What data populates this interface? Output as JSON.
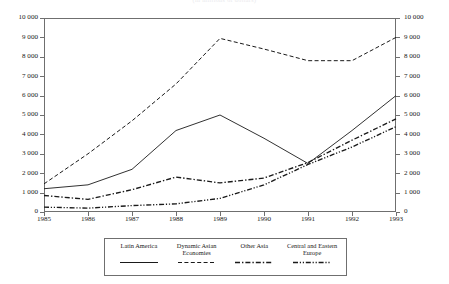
{
  "chart_title": "(in millions of dollars)",
  "axes": {
    "y_ticks": [
      "0",
      "1 000",
      "2 000",
      "3 000",
      "4 000",
      "5 000",
      "6 000",
      "7 000",
      "8 000",
      "9 000",
      "10 000"
    ],
    "x_ticks": [
      "1985",
      "1986",
      "1987",
      "1988",
      "1989",
      "1990",
      "1991",
      "1992",
      "1993"
    ],
    "ylabel": "",
    "xlabel": ""
  },
  "legend": {
    "items": [
      {
        "label": "Latin America",
        "style": "solid",
        "key_name": "legend-key-latin-america"
      },
      {
        "label": "Dynamic Asian Economies",
        "style": "dashed",
        "key_name": "legend-key-dynamic-asian-economies"
      },
      {
        "label": "Other Asia",
        "style": "dashdot",
        "key_name": "legend-key-other-asia"
      },
      {
        "label": "Central and Eastern Europe",
        "style": "dashdotdot",
        "key_name": "legend-key-central-and-eastern-europe"
      }
    ]
  },
  "colors": {
    "line": "#1a1a1a",
    "frame": "#6f6f6f",
    "text": "#242424"
  },
  "chart_data": {
    "type": "line",
    "title": "(in millions of dollars)",
    "xlabel": "",
    "ylabel": "",
    "x": [
      1985,
      1986,
      1987,
      1988,
      1989,
      1990,
      1991,
      1992,
      1993
    ],
    "xlim": [
      1985,
      1993
    ],
    "ylim": [
      0,
      10000
    ],
    "ytick_step": 1000,
    "grid": false,
    "legend_position": "bottom",
    "dual_y_axis": true,
    "series": [
      {
        "name": "Latin America",
        "style": "solid",
        "values": [
          1200,
          1400,
          2200,
          4200,
          5000,
          3800,
          2500,
          4200,
          6000
        ]
      },
      {
        "name": "Dynamic Asian Economies",
        "style": "dashed",
        "values": [
          1450,
          3000,
          4700,
          6600,
          8950,
          8400,
          7800,
          7800,
          9000
        ]
      },
      {
        "name": "Other Asia",
        "style": "dashdot",
        "values": [
          850,
          650,
          1150,
          1800,
          1500,
          1750,
          2550,
          3700,
          4800
        ]
      },
      {
        "name": "Central and Eastern Europe",
        "style": "dashdotdot",
        "values": [
          250,
          200,
          330,
          420,
          700,
          1400,
          2450,
          3350,
          4400
        ]
      }
    ]
  }
}
